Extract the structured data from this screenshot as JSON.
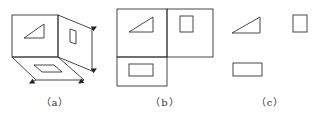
{
  "figure": {
    "panels": [
      {
        "id": "a",
        "label": "（a）",
        "description": "Isometric view of three mutually perpendicular projection planes (front, right side, bottom) with a triangle on the front plane, a small rectangle on the side plane and a rectangle on the bottom plane; arrows indicate unfolding"
      },
      {
        "id": "b",
        "label": "（b）",
        "description": "Unfolded projection planes: front view with triangle (top-left), side view with square (top-right), top view with rectangle (bottom-left)"
      },
      {
        "id": "c",
        "label": "（c）",
        "description": "Three projection views without plane borders: triangle, square, rectangle"
      }
    ],
    "colors": {
      "stroke": "#333333",
      "background": "#ffffff"
    }
  }
}
